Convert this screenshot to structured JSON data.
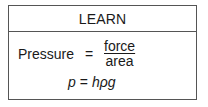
{
  "header": {
    "title": "LEARN"
  },
  "formula1": {
    "label": "Pressure",
    "equals": "=",
    "numerator": "force",
    "denominator": "area"
  },
  "formula2": {
    "lhs": "p",
    "equals": "=",
    "rhs": "hρg"
  }
}
